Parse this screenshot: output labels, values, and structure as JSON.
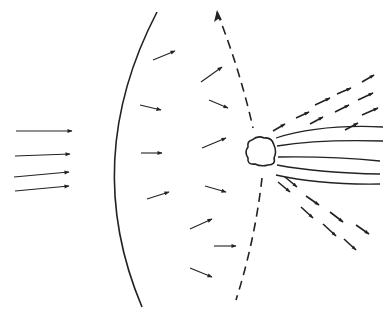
{
  "diagram": {
    "colors": {
      "stroke": "#222222",
      "background": "#ffffff"
    },
    "incident_arrows": [
      {
        "x1": 16,
        "y1": 131,
        "x2": 72,
        "y2": 131
      },
      {
        "x1": 15,
        "y1": 156,
        "x2": 70,
        "y2": 154
      },
      {
        "x1": 14,
        "y1": 177,
        "x2": 69,
        "y2": 172
      },
      {
        "x1": 15,
        "y1": 191,
        "x2": 69,
        "y2": 186
      }
    ],
    "solid_wavefront": {
      "path": "M157,12 Q80,160 142,307"
    },
    "dashed_wavefront": {
      "upper_path": "M217,12 Q240,70 253,128",
      "lower_path": "M262,178 Q255,240 236,300",
      "arrow_tip": {
        "x": 217,
        "y": 10
      }
    },
    "field_arrows": [
      {
        "x1": 153,
        "y1": 60,
        "x2": 175,
        "y2": 51
      },
      {
        "x1": 201,
        "y1": 82,
        "x2": 222,
        "y2": 67
      },
      {
        "x1": 140,
        "y1": 105,
        "x2": 161,
        "y2": 110
      },
      {
        "x1": 209,
        "y1": 100,
        "x2": 228,
        "y2": 108
      },
      {
        "x1": 141,
        "y1": 153,
        "x2": 162,
        "y2": 153
      },
      {
        "x1": 202,
        "y1": 148,
        "x2": 226,
        "y2": 138
      },
      {
        "x1": 147,
        "y1": 199,
        "x2": 169,
        "y2": 192
      },
      {
        "x1": 205,
        "y1": 186,
        "x2": 226,
        "y2": 192
      },
      {
        "x1": 190,
        "y1": 229,
        "x2": 212,
        "y2": 219
      },
      {
        "x1": 214,
        "y1": 246,
        "x2": 236,
        "y2": 246
      },
      {
        "x1": 190,
        "y1": 268,
        "x2": 212,
        "y2": 277
      }
    ],
    "obstacle": {
      "path": "M252,140 Q258,135 264,138 Q272,137 274,145 Q277,152 274,158 Q276,165 268,165 Q261,167 255,164 Q247,165 248,158 Q244,152 248,147 Q247,141 252,140 Z"
    },
    "streamlines": [
      {
        "path": "M276,138 Q320,124 383,127"
      },
      {
        "path": "M277,146 Q320,139 383,141"
      },
      {
        "path": "M278,157 Q330,156 380,161"
      },
      {
        "path": "M277,165 Q320,173 380,174"
      },
      {
        "path": "M276,175 Q320,185 380,184"
      }
    ],
    "scattered_arrows_up": [
      {
        "x1": 273,
        "y1": 131,
        "x2": 285,
        "y2": 124
      },
      {
        "x1": 296,
        "y1": 118,
        "x2": 309,
        "y2": 112
      },
      {
        "x1": 315,
        "y1": 105,
        "x2": 330,
        "y2": 98
      },
      {
        "x1": 337,
        "y1": 94,
        "x2": 351,
        "y2": 88
      },
      {
        "x1": 362,
        "y1": 82,
        "x2": 374,
        "y2": 75
      },
      {
        "x1": 310,
        "y1": 124,
        "x2": 323,
        "y2": 117
      },
      {
        "x1": 335,
        "y1": 112,
        "x2": 349,
        "y2": 105
      },
      {
        "x1": 358,
        "y1": 100,
        "x2": 373,
        "y2": 93
      },
      {
        "x1": 345,
        "y1": 130,
        "x2": 358,
        "y2": 123
      },
      {
        "x1": 362,
        "y1": 115,
        "x2": 378,
        "y2": 108
      }
    ],
    "scattered_arrows_down": [
      {
        "x1": 278,
        "y1": 182,
        "x2": 290,
        "y2": 192
      },
      {
        "x1": 285,
        "y1": 177,
        "x2": 297,
        "y2": 187
      },
      {
        "x1": 306,
        "y1": 196,
        "x2": 319,
        "y2": 205
      },
      {
        "x1": 301,
        "y1": 207,
        "x2": 313,
        "y2": 218
      },
      {
        "x1": 330,
        "y1": 212,
        "x2": 343,
        "y2": 222
      },
      {
        "x1": 323,
        "y1": 224,
        "x2": 336,
        "y2": 236
      },
      {
        "x1": 356,
        "y1": 225,
        "x2": 369,
        "y2": 234
      },
      {
        "x1": 344,
        "y1": 239,
        "x2": 356,
        "y2": 250
      }
    ]
  }
}
